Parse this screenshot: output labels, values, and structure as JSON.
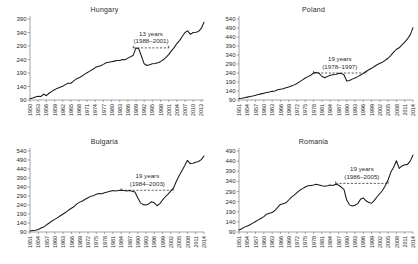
{
  "figure": {
    "panel_order": [
      "hungary",
      "poland",
      "bulgaria",
      "romania"
    ]
  },
  "chart_data": [
    {
      "type": "line",
      "title": "Hungary",
      "xlabel": "",
      "ylabel": "",
      "grid": false,
      "legend": null,
      "xlim": [
        1950,
        2014
      ],
      "ylim": [
        90,
        390
      ],
      "yticks": [
        90,
        140,
        190,
        240,
        290,
        340,
        390
      ],
      "xticks": [
        1950,
        1953,
        1956,
        1959,
        1962,
        1965,
        1968,
        1971,
        1974,
        1977,
        1980,
        1983,
        1986,
        1989,
        1992,
        1995,
        1998,
        2001,
        2004,
        2007,
        2010,
        2013
      ],
      "annotation": {
        "line1": "13 years",
        "line2": "(1988–2001)",
        "span_start": 1988,
        "span_end": 2001,
        "span_level": 283
      },
      "x": [
        1950,
        1951,
        1952,
        1953,
        1954,
        1955,
        1956,
        1957,
        1958,
        1959,
        1960,
        1961,
        1962,
        1963,
        1964,
        1965,
        1966,
        1967,
        1968,
        1969,
        1970,
        1971,
        1972,
        1973,
        1974,
        1975,
        1976,
        1977,
        1978,
        1979,
        1980,
        1981,
        1982,
        1983,
        1984,
        1985,
        1986,
        1987,
        1988,
        1989,
        1990,
        1991,
        1992,
        1993,
        1994,
        1995,
        1996,
        1997,
        1998,
        1999,
        2000,
        2001,
        2002,
        2003,
        2004,
        2005,
        2006,
        2007,
        2008,
        2009,
        2010,
        2011,
        2012,
        2013,
        2014
      ],
      "y": [
        95,
        97,
        101,
        104,
        103,
        112,
        106,
        115,
        122,
        128,
        133,
        137,
        141,
        147,
        152,
        152,
        160,
        168,
        172,
        178,
        185,
        191,
        197,
        203,
        210,
        214,
        217,
        222,
        228,
        230,
        232,
        234,
        236,
        236,
        240,
        239,
        245,
        250,
        256,
        283,
        280,
        252,
        224,
        218,
        221,
        224,
        225,
        228,
        232,
        239,
        248,
        258,
        272,
        284,
        299,
        310,
        325,
        340,
        346,
        333,
        340,
        341,
        344,
        355,
        378
      ]
    },
    {
      "type": "line",
      "title": "Poland",
      "xlabel": "",
      "ylabel": "",
      "grid": false,
      "legend": null,
      "xlim": [
        1951,
        2014
      ],
      "ylim": [
        90,
        540
      ],
      "yticks": [
        90,
        140,
        190,
        240,
        290,
        340,
        390,
        440,
        490,
        540
      ],
      "xticks": [
        1951,
        1954,
        1957,
        1960,
        1963,
        1966,
        1969,
        1972,
        1975,
        1978,
        1981,
        1984,
        1987,
        1990,
        1993,
        1996,
        1999,
        2002,
        2005,
        2008,
        2011,
        2014
      ],
      "annotation": {
        "line1": "19 years",
        "line2": "(1978–1997)",
        "span_start": 1978,
        "span_end": 1997,
        "span_level": 240
      },
      "x": [
        1951,
        1952,
        1953,
        1954,
        1955,
        1956,
        1957,
        1958,
        1959,
        1960,
        1961,
        1962,
        1963,
        1964,
        1965,
        1966,
        1967,
        1968,
        1969,
        1970,
        1971,
        1972,
        1973,
        1974,
        1975,
        1976,
        1977,
        1978,
        1979,
        1980,
        1981,
        1982,
        1983,
        1984,
        1985,
        1986,
        1987,
        1988,
        1989,
        1990,
        1991,
        1992,
        1993,
        1994,
        1995,
        1996,
        1997,
        1998,
        1999,
        2000,
        2001,
        2002,
        2003,
        2004,
        2005,
        2006,
        2007,
        2008,
        2009,
        2010,
        2011,
        2012,
        2013,
        2014
      ],
      "y": [
        98,
        100,
        103,
        106,
        109,
        112,
        116,
        120,
        124,
        128,
        132,
        134,
        138,
        140,
        147,
        150,
        153,
        158,
        162,
        168,
        174,
        182,
        192,
        202,
        212,
        220,
        228,
        240,
        243,
        238,
        222,
        214,
        220,
        228,
        230,
        232,
        237,
        238,
        230,
        196,
        198,
        206,
        212,
        220,
        229,
        238,
        248,
        258,
        266,
        276,
        286,
        294,
        300,
        312,
        322,
        338,
        356,
        372,
        380,
        396,
        412,
        430,
        452,
        492
      ]
    },
    {
      "type": "line",
      "title": "Bulgaria",
      "xlabel": "",
      "ylabel": "",
      "grid": false,
      "legend": null,
      "xlim": [
        1951,
        2014
      ],
      "ylim": [
        90,
        540
      ],
      "yticks": [
        90,
        140,
        190,
        240,
        290,
        340,
        390,
        440,
        490,
        540
      ],
      "xticks": [
        1951,
        1954,
        1957,
        1960,
        1963,
        1966,
        1969,
        1972,
        1975,
        1978,
        1981,
        1984,
        1987,
        1990,
        1993,
        1996,
        1999,
        2002,
        2005,
        2008,
        2011,
        2014
      ],
      "annotation": {
        "line1": "19 years",
        "line2": "(1984–2003)",
        "span_start": 1984,
        "span_end": 2003,
        "span_level": 322
      },
      "x": [
        1951,
        1952,
        1953,
        1954,
        1955,
        1956,
        1957,
        1958,
        1959,
        1960,
        1961,
        1962,
        1963,
        1964,
        1965,
        1966,
        1967,
        1968,
        1969,
        1970,
        1971,
        1972,
        1973,
        1974,
        1975,
        1976,
        1977,
        1978,
        1979,
        1980,
        1981,
        1982,
        1983,
        1984,
        1985,
        1986,
        1987,
        1988,
        1989,
        1990,
        1991,
        1992,
        1993,
        1994,
        1995,
        1996,
        1997,
        1998,
        1999,
        2000,
        2001,
        2002,
        2003,
        2004,
        2005,
        2006,
        2007,
        2008,
        2009,
        2010,
        2011,
        2012,
        2013,
        2014
      ],
      "y": [
        96,
        98,
        100,
        104,
        112,
        118,
        130,
        140,
        152,
        160,
        170,
        180,
        190,
        200,
        212,
        222,
        232,
        246,
        256,
        262,
        272,
        280,
        288,
        292,
        300,
        304,
        302,
        308,
        312,
        316,
        320,
        318,
        320,
        322,
        320,
        318,
        320,
        316,
        312,
        280,
        252,
        242,
        240,
        246,
        258,
        252,
        236,
        248,
        268,
        286,
        300,
        318,
        336,
        372,
        402,
        430,
        458,
        488,
        470,
        472,
        478,
        482,
        492,
        512
      ]
    },
    {
      "type": "line",
      "title": "Romania",
      "xlabel": "",
      "ylabel": "",
      "grid": false,
      "legend": null,
      "xlim": [
        1951,
        2014
      ],
      "ylim": [
        90,
        490
      ],
      "yticks": [
        90,
        140,
        190,
        240,
        290,
        340,
        390,
        440,
        490
      ],
      "xticks": [
        1951,
        1954,
        1957,
        1960,
        1963,
        1966,
        1969,
        1972,
        1975,
        1978,
        1981,
        1984,
        1987,
        1990,
        1993,
        1996,
        1999,
        2002,
        2005,
        2008,
        2011,
        2014
      ],
      "annotation": {
        "line1": "19 years",
        "line2": "(1986–2005)",
        "span_start": 1986,
        "span_end": 2005,
        "span_level": 330
      },
      "x": [
        1951,
        1952,
        1953,
        1954,
        1955,
        1956,
        1957,
        1958,
        1959,
        1960,
        1961,
        1962,
        1963,
        1964,
        1965,
        1966,
        1967,
        1968,
        1969,
        1970,
        1971,
        1972,
        1973,
        1974,
        1975,
        1976,
        1977,
        1978,
        1979,
        1980,
        1981,
        1982,
        1983,
        1984,
        1985,
        1986,
        1987,
        1988,
        1989,
        1990,
        1991,
        1992,
        1993,
        1994,
        1995,
        1996,
        1997,
        1998,
        1999,
        2000,
        2001,
        2002,
        2003,
        2004,
        2005,
        2006,
        2007,
        2008,
        2009,
        2010,
        2011,
        2012,
        2013,
        2014
      ],
      "y": [
        100,
        106,
        114,
        120,
        126,
        134,
        142,
        150,
        158,
        166,
        178,
        182,
        186,
        196,
        212,
        226,
        230,
        234,
        248,
        262,
        272,
        284,
        296,
        304,
        312,
        318,
        320,
        322,
        326,
        322,
        318,
        316,
        318,
        322,
        320,
        326,
        322,
        312,
        300,
        248,
        224,
        218,
        222,
        230,
        252,
        258,
        244,
        236,
        232,
        246,
        264,
        280,
        296,
        320,
        348,
        386,
        410,
        442,
        404,
        416,
        422,
        424,
        440,
        470
      ]
    }
  ]
}
